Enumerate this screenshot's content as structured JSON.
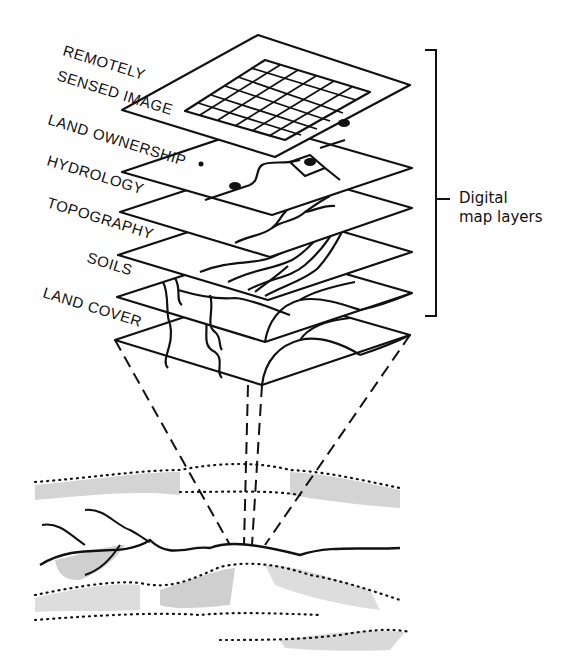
{
  "diagram": {
    "layers": [
      {
        "label": "REMOTELY"
      },
      {
        "label": "SENSED IMAGE"
      },
      {
        "label": "LAND OWNERSHIP"
      },
      {
        "label": "HYDROLOGY"
      },
      {
        "label": "TOPOGRAPHY"
      },
      {
        "label": "SOILS"
      },
      {
        "label": "LAND COVER"
      }
    ],
    "bracket_label_line1": "Digital",
    "bracket_label_line2": "map layers",
    "colors": {
      "ink": "#111111",
      "background": "#ffffff"
    }
  }
}
